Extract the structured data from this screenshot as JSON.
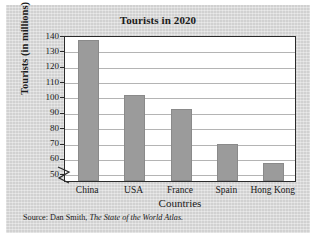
{
  "figure": {
    "source_prefix": "Source: Dan Smith,",
    "source_title": "The State of the World Atlas."
  },
  "chart_data": {
    "type": "bar",
    "title": "Tourists in 2020",
    "xlabel": "Countries",
    "ylabel": "Tourists (in millions)",
    "categories": [
      "China",
      "USA",
      "France",
      "Spain",
      "Hong Kong"
    ],
    "values": [
      137,
      101,
      92,
      69,
      57
    ],
    "ylim": [
      45,
      140
    ],
    "yticks": [
      50,
      60,
      70,
      80,
      90,
      100,
      110,
      120,
      130,
      140
    ],
    "grid": true,
    "axis_break": true,
    "legend": "none",
    "bar_color": "#9b9b9b",
    "plot_background": "#ffffff",
    "page_background": "#d9d9d9"
  }
}
